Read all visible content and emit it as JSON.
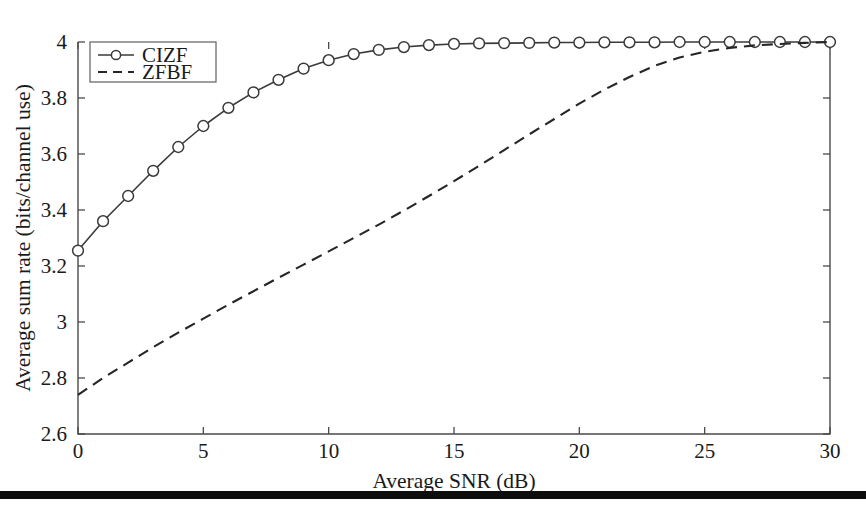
{
  "chart_data": {
    "type": "line",
    "title": "",
    "xlabel": "Average SNR (dB)",
    "ylabel": "Average sum rate (bits/channel use)",
    "xlim": [
      0,
      30
    ],
    "ylim": [
      2.6,
      4
    ],
    "xticks": [
      0,
      5,
      10,
      15,
      20,
      25,
      30
    ],
    "xticklabels": [
      "0",
      "5",
      "10",
      "15",
      "20",
      "25",
      "30"
    ],
    "yticks": [
      2.6,
      2.8,
      3,
      3.2,
      3.4,
      3.6,
      3.8,
      4
    ],
    "yticklabels": [
      "2.6",
      "2.8",
      "3",
      "3.2",
      "3.4",
      "3.6",
      "3.8",
      "4"
    ],
    "grid": false,
    "legend_position": "top-left",
    "x": [
      0,
      1,
      2,
      3,
      4,
      5,
      6,
      7,
      8,
      9,
      10,
      11,
      12,
      13,
      14,
      15,
      16,
      17,
      18,
      19,
      20,
      21,
      22,
      23,
      24,
      25,
      26,
      27,
      28,
      29,
      30
    ],
    "series": [
      {
        "name": "CIZF",
        "style": "solid",
        "marker": "circle",
        "color": "#3a3a3a",
        "values": [
          3.255,
          3.36,
          3.45,
          3.54,
          3.625,
          3.7,
          3.765,
          3.82,
          3.865,
          3.905,
          3.935,
          3.957,
          3.972,
          3.982,
          3.989,
          3.993,
          3.995,
          3.996,
          3.997,
          3.998,
          3.998,
          3.999,
          3.999,
          3.999,
          4.0,
          4.0,
          4.0,
          4.0,
          4.0,
          4.0,
          4.0
        ]
      },
      {
        "name": "ZFBF",
        "style": "dashed",
        "marker": "none",
        "color": "#262626",
        "values": [
          2.74,
          2.8,
          2.855,
          2.91,
          2.962,
          3.012,
          3.062,
          3.11,
          3.158,
          3.205,
          3.252,
          3.3,
          3.348,
          3.398,
          3.45,
          3.503,
          3.558,
          3.614,
          3.67,
          3.725,
          3.78,
          3.83,
          3.875,
          3.915,
          3.945,
          3.965,
          3.979,
          3.988,
          3.993,
          3.997,
          4.0
        ]
      }
    ]
  },
  "legend": {
    "entries": [
      {
        "label": "CIZF"
      },
      {
        "label": "ZFBF"
      }
    ]
  },
  "footer": {
    "rule_color": "#0d0d0d"
  }
}
